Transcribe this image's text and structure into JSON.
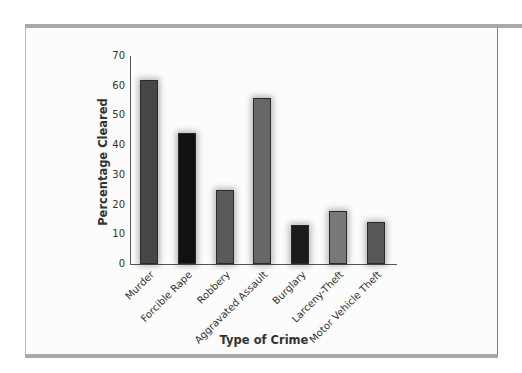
{
  "chart_data": {
    "type": "bar",
    "title": "",
    "xlabel": "Type of Crime",
    "ylabel": "Percentage Cleared",
    "ylim": [
      0,
      70
    ],
    "yticks": [
      0,
      10,
      20,
      30,
      40,
      50,
      60,
      70
    ],
    "grid": false,
    "legend": null,
    "categories": [
      "Murder",
      "Forcible Rape",
      "Robbery",
      "Aggravated Assault",
      "Burglary",
      "Larceny-Theft",
      "Motor Vehicle Theft"
    ],
    "values": [
      62,
      44,
      25,
      56,
      13,
      18,
      14
    ],
    "bar_colors": [
      "#474747",
      "#111111",
      "#5a5a5a",
      "#676767",
      "#1c1c1c",
      "#787878",
      "#575757"
    ]
  },
  "axis": {
    "y_title": "Percentage Cleared",
    "x_title": "Type of Crime",
    "tick_labels": [
      "0",
      "10",
      "20",
      "30",
      "40",
      "50",
      "60",
      "70"
    ]
  }
}
